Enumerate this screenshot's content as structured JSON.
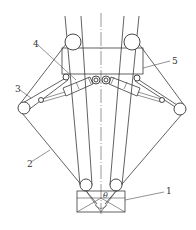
{
  "diagram": {
    "title": "",
    "background": "#ffffff",
    "stroke_color": "#3a3a3a",
    "labels": [
      {
        "id": "1",
        "text": "1",
        "x": 166,
        "y": 194
      },
      {
        "id": "2",
        "text": "2",
        "x": 27,
        "y": 167
      },
      {
        "id": "3",
        "text": "3",
        "x": 15,
        "y": 92
      },
      {
        "id": "4",
        "text": "4",
        "x": 33,
        "y": 47
      },
      {
        "id": "5",
        "text": "5",
        "x": 172,
        "y": 64
      }
    ],
    "angle_symbol": "θ",
    "components": [
      {
        "label": "1",
        "name": "load-box"
      },
      {
        "label": "2",
        "name": "outer-cable"
      },
      {
        "label": "3",
        "name": "outer-pulley"
      },
      {
        "label": "4",
        "name": "hydraulic-cylinder"
      },
      {
        "label": "5",
        "name": "top-frame"
      }
    ]
  }
}
